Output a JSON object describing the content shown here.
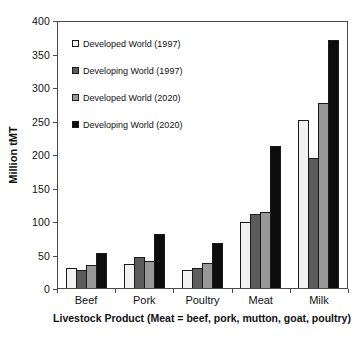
{
  "chart_data": {
    "type": "bar",
    "title": "",
    "ylabel": "Million tMT",
    "xlabel": "Livestock Product (Meat = beef, pork, mutton, goat, poultry)",
    "ylim": [
      0,
      400
    ],
    "ytick_step": 50,
    "grid": false,
    "legend_position": "top-left-inside",
    "categories": [
      "Beef",
      "Pork",
      "Poultry",
      "Meat",
      "Milk"
    ],
    "series": [
      {
        "name": "Developed World (1997)",
        "color": "#f2f2f2",
        "values": [
          30,
          36,
          27,
          100,
          252
        ]
      },
      {
        "name": "Developing World (1997)",
        "color": "#5c5c5c",
        "values": [
          27,
          46,
          30,
          111,
          195
        ]
      },
      {
        "name": "Developed World (2020)",
        "color": "#989898",
        "values": [
          34,
          40,
          38,
          114,
          278
        ]
      },
      {
        "name": "Developing World (2020)",
        "color": "#0d0d0d",
        "values": [
          52,
          81,
          68,
          213,
          373
        ]
      }
    ],
    "axis_color": "#4a4a4a",
    "bar_border_color": "#1a1a1a"
  }
}
